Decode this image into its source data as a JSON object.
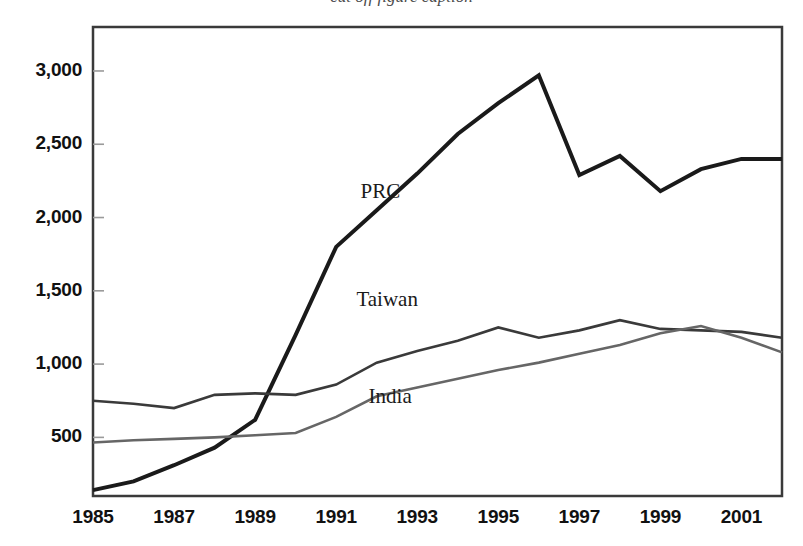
{
  "figure": {
    "clipped_caption": "cut off figure caption"
  },
  "chart_data": {
    "type": "line",
    "title": "",
    "subtitle": "",
    "xlabel": "",
    "ylabel": "",
    "xlim": [
      1985,
      2002
    ],
    "ylim": [
      100,
      3300
    ],
    "grid": false,
    "legend": "inline-labels",
    "x_tick_labels": [
      "1985",
      "1987",
      "1989",
      "1991",
      "1993",
      "1995",
      "1997",
      "1999",
      "2001"
    ],
    "x_tick_values": [
      1985,
      1987,
      1989,
      1991,
      1993,
      1995,
      1997,
      1999,
      2001
    ],
    "y_tick_labels": [
      "500",
      "1,000",
      "1,500",
      "2,000",
      "2,500",
      "3,000"
    ],
    "y_tick_values": [
      500,
      1000,
      1500,
      2000,
      2500,
      3000
    ],
    "x": [
      1985,
      1986,
      1987,
      1988,
      1989,
      1990,
      1991,
      1992,
      1993,
      1994,
      1995,
      1996,
      1997,
      1998,
      1999,
      2000,
      2001,
      2002
    ],
    "series": [
      {
        "name": "PRC",
        "color": "#1a1a1a",
        "width": 4.0,
        "label_x": 1991.6,
        "label_y": 2170,
        "values": [
          140,
          200,
          310,
          430,
          620,
          1200,
          1800,
          2050,
          2300,
          2570,
          2780,
          2970,
          2290,
          2420,
          2180,
          2330,
          2400,
          2400
        ]
      },
      {
        "name": "Taiwan",
        "color": "#3a3a3a",
        "width": 2.6,
        "label_x": 1991.5,
        "label_y": 1430,
        "values": [
          750,
          730,
          700,
          790,
          800,
          790,
          860,
          1010,
          1090,
          1160,
          1250,
          1180,
          1230,
          1300,
          1240,
          1230,
          1220,
          1180
        ]
      },
      {
        "name": "India",
        "color": "#666666",
        "width": 2.6,
        "label_x": 1991.8,
        "label_y": 770,
        "values": [
          465,
          480,
          490,
          500,
          515,
          530,
          640,
          780,
          840,
          900,
          960,
          1010,
          1070,
          1130,
          1210,
          1260,
          1180,
          1080
        ]
      }
    ],
    "series_detailed": {
      "note": "values read from axis; 2002 endpoints: PRC 2400, Taiwan 490, India 730",
      "prc_end": 2400,
      "taiwan_end": 490,
      "india_end": 730
    }
  },
  "axes": {
    "frame_color": "#3a3a3a"
  }
}
